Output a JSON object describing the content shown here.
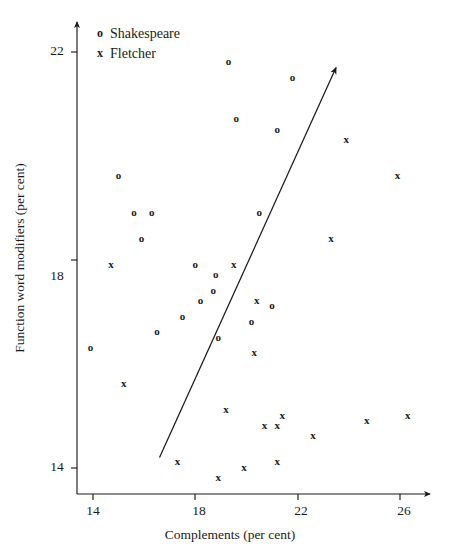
{
  "chart_data": {
    "type": "scatter",
    "title": "",
    "xlabel": "Complements (per cent)",
    "ylabel": "Function word modifiers (per cent)",
    "xlim": [
      12.6,
      27.8
    ],
    "ylim": [
      13.1,
      22.6
    ],
    "xticks": [
      14,
      18,
      22,
      26
    ],
    "yticks": [
      14,
      18,
      22
    ],
    "grid": false,
    "legend_position": "top-left",
    "legend": [
      {
        "symbol": "o",
        "label": "Shakespeare"
      },
      {
        "symbol": "x",
        "label": "Fletcher"
      }
    ],
    "series": [
      {
        "name": "Shakespeare",
        "symbol": "o",
        "points": [
          [
            19.3,
            21.8
          ],
          [
            21.8,
            21.5
          ],
          [
            19.6,
            20.7
          ],
          [
            21.2,
            20.5
          ],
          [
            15.0,
            19.6
          ],
          [
            15.6,
            18.9
          ],
          [
            16.3,
            18.9
          ],
          [
            20.5,
            18.9
          ],
          [
            15.9,
            18.4
          ],
          [
            18.0,
            17.9
          ],
          [
            18.8,
            17.7
          ],
          [
            18.7,
            17.4
          ],
          [
            18.2,
            17.2
          ],
          [
            17.5,
            16.9
          ],
          [
            21.0,
            17.1
          ],
          [
            20.2,
            16.8
          ],
          [
            16.5,
            16.6
          ],
          [
            13.9,
            16.3
          ],
          [
            18.9,
            16.5
          ]
        ]
      },
      {
        "name": "Fletcher",
        "symbol": "x",
        "points": [
          [
            23.9,
            20.3
          ],
          [
            25.9,
            19.6
          ],
          [
            23.3,
            18.4
          ],
          [
            19.5,
            17.9
          ],
          [
            14.7,
            17.9
          ],
          [
            20.4,
            17.2
          ],
          [
            20.3,
            16.2
          ],
          [
            15.2,
            15.6
          ],
          [
            19.2,
            15.1
          ],
          [
            20.7,
            14.8
          ],
          [
            21.4,
            15.0
          ],
          [
            21.2,
            14.8
          ],
          [
            22.6,
            14.6
          ],
          [
            24.7,
            14.9
          ],
          [
            26.3,
            15.0
          ],
          [
            17.3,
            14.1
          ],
          [
            18.9,
            13.8
          ],
          [
            19.9,
            14.0
          ],
          [
            21.2,
            14.1
          ]
        ]
      }
    ],
    "annotations": [
      {
        "type": "arrow-line",
        "name": "discriminant-axis",
        "from": [
          16.6,
          14.2
        ],
        "to": [
          23.5,
          21.7
        ]
      }
    ]
  }
}
